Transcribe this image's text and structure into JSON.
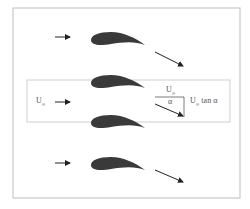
{
  "figure": {
    "labels": {
      "u_inf": "U",
      "u_inf_sub": "∞",
      "u_inf_top": "U",
      "u_inf_top_sub": "∞",
      "alpha": "α",
      "u_tan_prefix": "U",
      "u_tan_sub": "∞",
      "u_tan_suffix": " tan α"
    },
    "colors": {
      "airfoil": "#3a3a3a",
      "frame": "#bdbdbd",
      "arrow": "#222222"
    }
  }
}
